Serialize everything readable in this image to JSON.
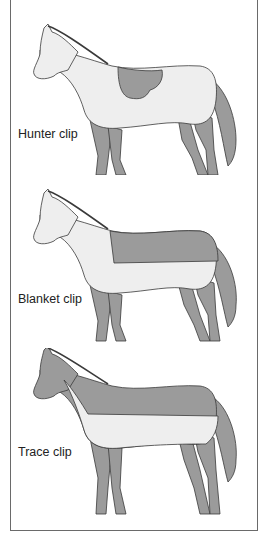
{
  "figure": {
    "colors": {
      "clipped": "#9b9b9b",
      "unclipped": "#eeeeee",
      "outline": "#3a3a3a",
      "border": "#6a6a6a"
    },
    "panels": [
      {
        "label": "Hunter clip"
      },
      {
        "label": "Blanket clip"
      },
      {
        "label": "Trace clip"
      }
    ]
  }
}
